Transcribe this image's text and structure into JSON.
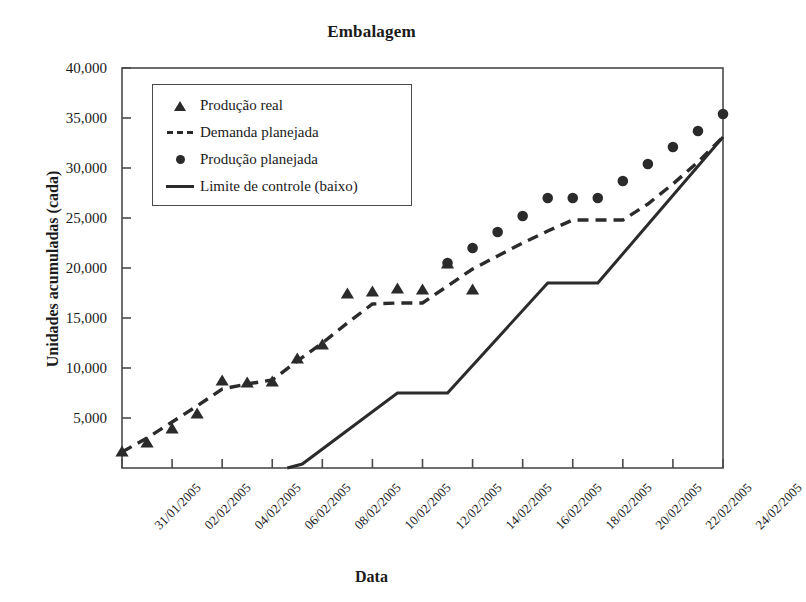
{
  "chart_data": {
    "type": "line",
    "title": "Embalagem",
    "xlabel": "Data",
    "ylabel": "Unidades acumuladas (cada)",
    "xlim": [
      0,
      24
    ],
    "ylim": [
      0,
      40000
    ],
    "grid": false,
    "legend_position": "upper-left-inside",
    "ytick_labels": [
      "40,000",
      "35,000",
      "30,000",
      "25,000",
      "20,000",
      "15,000",
      "10,000",
      "5,000"
    ],
    "ytick_values": [
      40000,
      35000,
      30000,
      25000,
      20000,
      15000,
      10000,
      5000
    ],
    "xtick_labels": [
      "31/01/2005",
      "02/02/2005",
      "04/02/2005",
      "06/02/2005",
      "08/02/2005",
      "10/02/2005",
      "12/02/2005",
      "14/02/2005",
      "16/02/2005",
      "18/02/2005",
      "20/02/2005",
      "22/02/2005",
      "24/02/2005"
    ],
    "xtick_values": [
      0,
      2,
      4,
      6,
      8,
      10,
      12,
      14,
      16,
      18,
      20,
      22,
      24
    ],
    "series": [
      {
        "name": "Produção real",
        "marker": "triangle",
        "style": "markers",
        "x": [
          0,
          1,
          2,
          3,
          4,
          5,
          6,
          7,
          8,
          9,
          10,
          11,
          12,
          13,
          14
        ],
        "values": [
          1700,
          2600,
          4000,
          5500,
          8800,
          8600,
          8700,
          11000,
          12400,
          17500,
          17700,
          18000,
          17900,
          20500,
          17900
        ]
      },
      {
        "name": "Demanda planejada",
        "marker": "none",
        "style": "dashed-line",
        "x": [
          0,
          1,
          2,
          3,
          4,
          5,
          6,
          7,
          8,
          9,
          10,
          11,
          12,
          13,
          14,
          15,
          16,
          17,
          18,
          19,
          20,
          21,
          22,
          23,
          24
        ],
        "values": [
          1600,
          3000,
          4600,
          6200,
          7900,
          8400,
          8800,
          10700,
          12500,
          14500,
          16400,
          16500,
          16500,
          18200,
          19900,
          21200,
          22500,
          23700,
          24800,
          24800,
          24800,
          26400,
          28400,
          30600,
          33100
        ]
      },
      {
        "name": "Produção planejada",
        "marker": "circle",
        "style": "markers",
        "x": [
          13,
          14,
          15,
          16,
          17,
          18,
          19,
          20,
          21,
          22,
          23,
          24
        ],
        "values": [
          20500,
          22000,
          23600,
          25200,
          27000,
          27000,
          27000,
          28700,
          30400,
          32100,
          33700,
          35400
        ]
      },
      {
        "name": "Limite de controle (baixo)",
        "marker": "none",
        "style": "solid-line",
        "x": [
          6.6,
          7.2,
          11,
          13,
          17,
          19,
          24
        ],
        "values": [
          0,
          400,
          7500,
          7500,
          18500,
          18500,
          33100
        ]
      }
    ]
  },
  "legend": {
    "items": [
      {
        "key": "triangle",
        "label": "Produção real"
      },
      {
        "key": "dashed",
        "label": "Demanda planejada"
      },
      {
        "key": "circle",
        "label": "Produção planejada"
      },
      {
        "key": "solid",
        "label": "Limite de controle (baixo)"
      }
    ]
  },
  "colors": {
    "ink": "#2b2b2b",
    "axis": "#4a4a4a",
    "background": "#ffffff"
  }
}
